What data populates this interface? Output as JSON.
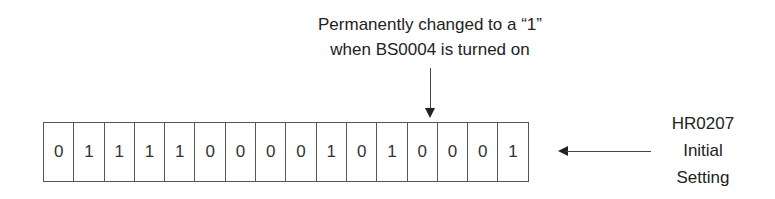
{
  "diagram": {
    "top_annotation": {
      "lines": [
        "Permanently changed to a “1”",
        "when BS0004 is turned on"
      ],
      "target_bit_index": 12
    },
    "register": {
      "bits": [
        "0",
        "1",
        "1",
        "1",
        "1",
        "0",
        "0",
        "0",
        "0",
        "1",
        "0",
        "1",
        "0",
        "0",
        "0",
        "1"
      ]
    },
    "right_annotation": {
      "lines": [
        "HR0207",
        "Initial",
        "Setting"
      ]
    },
    "colors": {
      "line": "#555555",
      "text": "#222222",
      "background": "#ffffff"
    }
  }
}
